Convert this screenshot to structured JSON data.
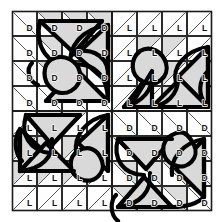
{
  "figure": {
    "grid": {
      "rows": 8,
      "cols": 8,
      "cell_px": 25
    },
    "colors": {
      "background": "#ffffff",
      "shade": "#dcdcdc",
      "grid_line": "#2b2b2b",
      "diagonal_line": "#555555",
      "motif_stroke": "#000000",
      "label_text": "#111111"
    },
    "legend_keys": {
      "dark": "D",
      "light": "L"
    }
  },
  "quadrants": [
    {
      "name": "top-left",
      "letter": "D",
      "diagonal": "tl-br",
      "label_corner": "bottom-left",
      "origin": {
        "col": 0,
        "row": 0
      }
    },
    {
      "name": "top-right",
      "letter": "L",
      "diagonal": "bl-tr",
      "label_corner": "bottom-left",
      "origin": {
        "col": 4,
        "row": 0
      }
    },
    {
      "name": "bottom-left",
      "letter": "L",
      "diagonal": "bl-tr",
      "label_corner": "bottom-left",
      "origin": {
        "col": 0,
        "row": 4
      }
    },
    {
      "name": "bottom-right",
      "letter": "D",
      "diagonal": "tl-br",
      "label_corner": "bottom-left",
      "origin": {
        "col": 4,
        "row": 4
      }
    }
  ],
  "cell_labels": [
    [
      "D",
      "D",
      "D",
      "D",
      "L",
      "L",
      "L",
      "L"
    ],
    [
      "D",
      "D",
      "D",
      "D",
      "L",
      "L",
      "L",
      "L"
    ],
    [
      "D",
      "D",
      "D",
      "D",
      "L",
      "L",
      "L",
      "L"
    ],
    [
      "D",
      "D",
      "D",
      "D",
      "L",
      "L",
      "L",
      "L"
    ],
    [
      "L",
      "L",
      "L",
      "L",
      "D",
      "D",
      "D",
      "D"
    ],
    [
      "L",
      "L",
      "L",
      "L",
      "D",
      "D",
      "D",
      "D"
    ],
    [
      "L",
      "L",
      "L",
      "L",
      "D",
      "D",
      "D",
      "D"
    ],
    [
      "L",
      "L",
      "L",
      "L",
      "D",
      "D",
      "D",
      "D"
    ]
  ],
  "shaded_cells": [
    [
      false,
      true,
      true,
      true,
      false,
      false,
      false,
      false
    ],
    [
      false,
      true,
      true,
      true,
      false,
      true,
      true,
      false
    ],
    [
      false,
      true,
      true,
      true,
      false,
      true,
      true,
      true
    ],
    [
      false,
      false,
      false,
      false,
      false,
      false,
      true,
      false
    ],
    [
      false,
      true,
      true,
      false,
      false,
      false,
      false,
      false
    ],
    [
      true,
      true,
      true,
      true,
      true,
      true,
      true,
      false
    ],
    [
      true,
      true,
      true,
      true,
      true,
      true,
      true,
      false
    ],
    [
      false,
      false,
      false,
      false,
      true,
      true,
      true,
      false
    ]
  ]
}
